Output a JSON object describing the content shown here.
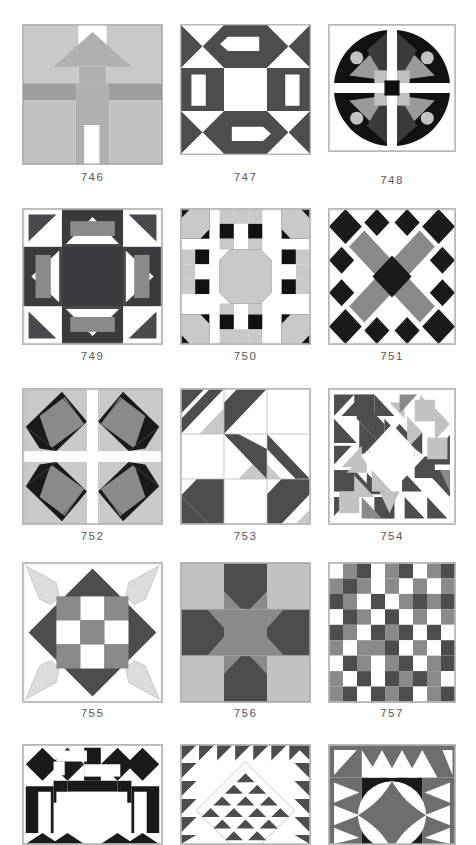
{
  "page": {
    "kind": "quilt-block-pattern-catalog-page",
    "background_color": "#ffffff",
    "width": 476,
    "height": 845,
    "columns": 3,
    "rows": 5,
    "caption_color": "#58585a",
    "block_border_color": "#b9b9b9"
  },
  "palette": {
    "white": "#ffffff",
    "black": "#1a1a1a",
    "dark_gray": "#58585a",
    "mid_gray": "#8a8a8c",
    "light_gray": "#c9c9c9",
    "pale_gray": "#dcdcdc",
    "outline": "#b9b9b9"
  },
  "blocks": [
    {
      "number": "746",
      "name": "house-block",
      "description": "Schoolhouse / house block with peaked roof, chimney-less facade, door and side walls in light grays",
      "row": 1,
      "col": 1,
      "x": 22,
      "y": 24,
      "size": 141,
      "caption_y": 165
    },
    {
      "number": "747",
      "name": "hourglass-and-arrows-block",
      "description": "Nine patch with dark hourglass corners, white arrow/bar units on edges and white center square",
      "row": 1,
      "col": 2,
      "x": 180,
      "y": 24,
      "size": 131,
      "caption_y": 165
    },
    {
      "number": "748",
      "name": "curved-eye-fan-block",
      "description": "Four black curved fan shapes with pale circles, gray kites, dark center square",
      "row": 1,
      "col": 3,
      "x": 328,
      "y": 24,
      "size": 128,
      "caption_y": 170
    },
    {
      "number": "749",
      "name": "dark-star-bars-block",
      "description": "Dark ground block with gray bars inside white diamonds and dark center square",
      "row": 2,
      "col": 1,
      "x": 22,
      "y": 208,
      "size": 141,
      "caption_y": 348
    },
    {
      "number": "750",
      "name": "octagon-medallion-block",
      "description": "Light octagon medallion centered with checkered and snowball corner units",
      "row": 2,
      "col": 2,
      "x": 180,
      "y": 208,
      "size": 131,
      "caption_y": 348
    },
    {
      "number": "751",
      "name": "gray-x-block",
      "description": "Gray X cross with dark center square and black diamond corner clusters",
      "row": 2,
      "col": 3,
      "x": 328,
      "y": 208,
      "size": 128,
      "caption_y": 348
    },
    {
      "number": "752",
      "name": "pinwheel-kite-block",
      "description": "Four kite quadrants of black and gray on pale ground split by a white cross",
      "row": 3,
      "col": 1,
      "x": 22,
      "y": 388,
      "size": 141,
      "caption_y": 528
    },
    {
      "number": "753",
      "name": "diagonal-stripe-block",
      "description": "Nine patch of diagonal stripe units in dark gray, light gray and white",
      "row": 3,
      "col": 2,
      "x": 180,
      "y": 388,
      "size": 131,
      "caption_y": 528
    },
    {
      "number": "754",
      "name": "scrappy-octagon-block",
      "description": "Dense scrappy triangle block with a white octagon at the center",
      "row": 3,
      "col": 3,
      "x": 328,
      "y": 388,
      "size": 128,
      "caption_y": 528
    },
    {
      "number": "755",
      "name": "diamond-nine-patch-block",
      "description": "Dark on point diamond containing a nine patch, with pale corner fan shapes",
      "row": 4,
      "col": 1,
      "x": 22,
      "y": 562,
      "size": 141,
      "caption_y": 706
    },
    {
      "number": "756",
      "name": "star-cross-block",
      "description": "Gray eight point star over alternating light and dark gray background patches",
      "row": 4,
      "col": 2,
      "x": 180,
      "y": 562,
      "size": 131,
      "caption_y": 706
    },
    {
      "number": "757",
      "name": "scrappy-checkerboard-block",
      "description": "Irregular checkerboard of white, medium gray and dark gray squares",
      "row": 4,
      "col": 3,
      "x": 328,
      "y": 562,
      "size": 128,
      "caption_y": 706
    },
    {
      "number": "758",
      "name": "bowtie-chain-block",
      "description": "Black bow tie and chain units framing white bars and a white center",
      "row": 5,
      "col": 1,
      "x": 22,
      "y": 744,
      "size": 141,
      "caption_y": 0
    },
    {
      "number": "759",
      "name": "sawtooth-diamond-block",
      "description": "On point white diamond edged with sawtooth triangles inside a sawtooth border",
      "row": 5,
      "col": 2,
      "x": 180,
      "y": 744,
      "size": 131,
      "caption_y": 0
    },
    {
      "number": "760",
      "name": "orange-peel-ray-block",
      "description": "Central four petal orange peel motif surrounded by radiating sawtooth rays",
      "row": 5,
      "col": 3,
      "x": 328,
      "y": 744,
      "size": 128,
      "caption_y": 0
    }
  ]
}
